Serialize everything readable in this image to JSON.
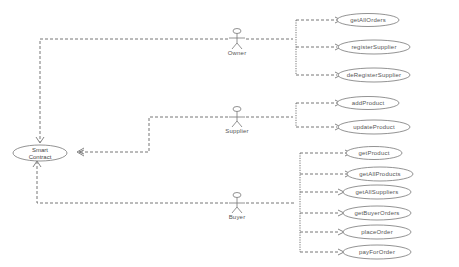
{
  "diagram": {
    "type": "use-case",
    "central": {
      "id": "smart-contract",
      "label_line1": "Smart",
      "label_line2": "Contract"
    },
    "actors": [
      {
        "name": "Owner",
        "use_cases": [
          "getAllOrders",
          "registerSupplier",
          "deRegisterSupplier"
        ]
      },
      {
        "name": "Supplier",
        "use_cases": [
          "addProduct",
          "updateProduct"
        ]
      },
      {
        "name": "Buyer",
        "use_cases": [
          "getProduct",
          "getAllProducts",
          "getAllSuppliers",
          "getBuyerOrders",
          "placeOrder",
          "payForOrder"
        ]
      }
    ],
    "line_color": "#666666",
    "ellipse_stroke": "#777777"
  }
}
